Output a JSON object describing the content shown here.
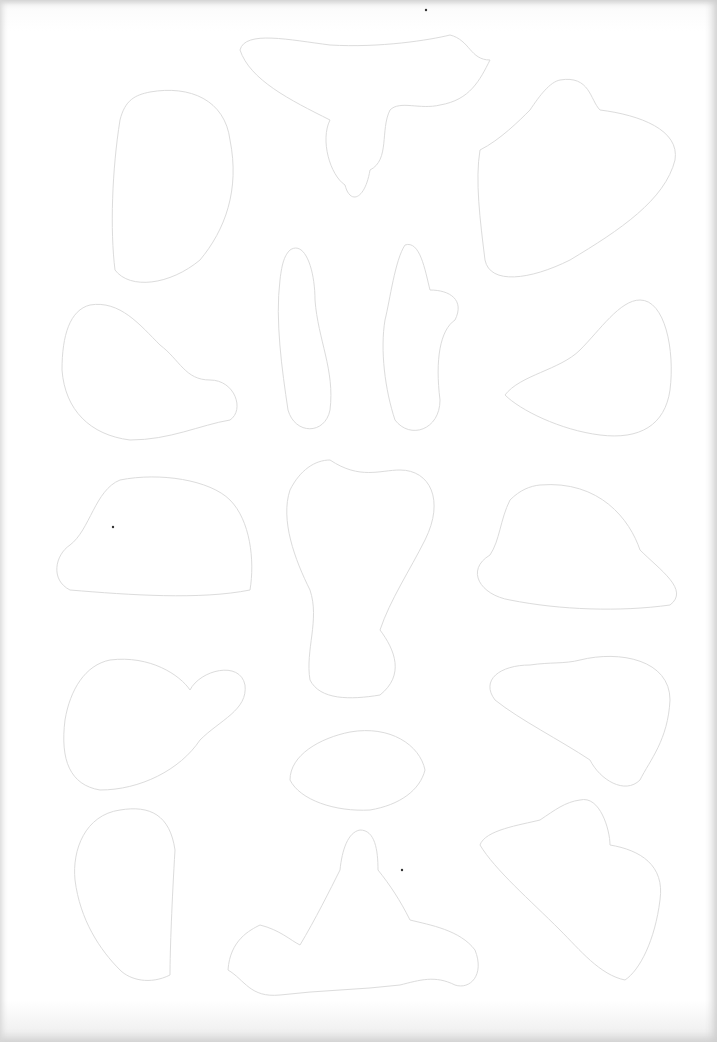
{
  "page": {
    "background_color": "#ffffff",
    "outline_color": "#dcdcdc",
    "shape_count": 16
  }
}
